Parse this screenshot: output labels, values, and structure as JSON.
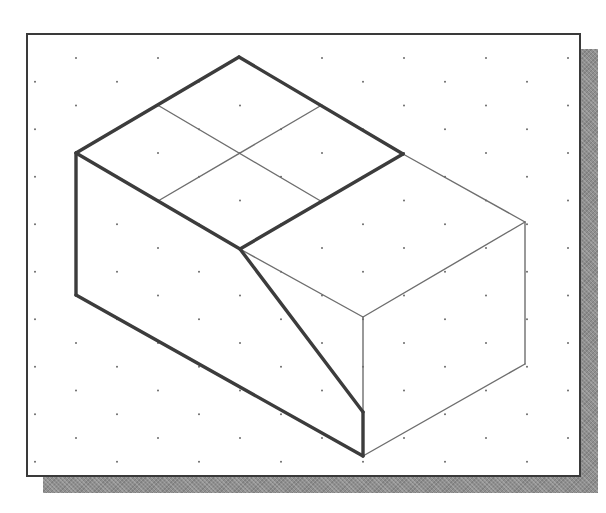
{
  "figure": {
    "type": "isometric-sketch",
    "colors": {
      "background": "#ffffff",
      "frame_border": "#3a3a3a",
      "shadow": "#8f8f8f",
      "grid_dot": "#6a6a6a",
      "thick_line": "#3c3c3c",
      "thin_line": "#6e6e6e"
    },
    "grid": {
      "spacing_x": 82,
      "row_step_y": 23.75,
      "row_offset_x": 41,
      "first_row_y": 58
    },
    "vertices": {
      "top": [
        239,
        57
      ],
      "left_top": [
        76,
        153
      ],
      "left_bottom": [
        76,
        295
      ],
      "front_mid": [
        240,
        249
      ],
      "right_top_upper": [
        403,
        154
      ],
      "right_far": [
        525,
        222
      ],
      "right_far_bottom": [
        525,
        364
      ],
      "front_corner": [
        363,
        317
      ],
      "slope_end": [
        363,
        412
      ],
      "bottom": [
        363,
        456
      ]
    },
    "thick_edges": [
      [
        "left_top",
        "top"
      ],
      [
        "top",
        "right_top_upper"
      ],
      [
        "right_top_upper",
        "front_mid"
      ],
      [
        "front_mid",
        "left_top"
      ],
      [
        "left_top",
        "left_bottom"
      ],
      [
        "left_bottom",
        "bottom"
      ],
      [
        "bottom",
        "slope_end"
      ],
      [
        "slope_end",
        "front_mid"
      ]
    ],
    "thin_edges": [
      [
        "right_top_upper",
        "right_far"
      ],
      [
        "right_far",
        "front_corner"
      ],
      [
        "front_corner",
        "front_mid"
      ],
      [
        "right_far",
        "right_far_bottom"
      ],
      [
        "right_far_bottom",
        "bottom"
      ],
      [
        "front_corner",
        "slope_end"
      ],
      [
        "grid_a1",
        "grid_a2"
      ],
      [
        "grid_b1",
        "grid_b2"
      ]
    ],
    "inner_grid_points": {
      "grid_a1": [
        157.5,
        105
      ],
      "grid_a2": [
        321.5,
        201.5
      ],
      "grid_b1": [
        158,
        201
      ],
      "grid_b2": [
        321,
        105.5
      ]
    }
  }
}
